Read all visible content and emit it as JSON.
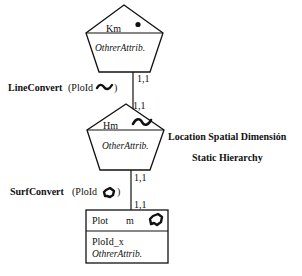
{
  "diagram": {
    "levels": [
      {
        "id": "km",
        "shape": "pentagon",
        "name": "Km",
        "icon": "point-icon",
        "attributes": [
          "OthrerAttrib."
        ]
      },
      {
        "id": "hm",
        "shape": "pentagon",
        "name": "Hm",
        "icon": "line-icon",
        "attributes": [
          "OtherAttrib."
        ]
      },
      {
        "id": "plot",
        "shape": "rectangle",
        "name": "Plot",
        "subname": "m",
        "icon": "surface-icon",
        "attributes": [
          "PloId_x",
          "OthrerAttrib."
        ]
      }
    ],
    "relationships": [
      {
        "label": "LineConvert",
        "param": "(PloId",
        "param_close": ")",
        "icon": "line-icon",
        "card_top": "1,1",
        "card_bottom": "1,1"
      },
      {
        "label": "SurfConvert",
        "param": "(PloId",
        "param_close": ")",
        "icon": "surface-icon",
        "card_top": "1,1",
        "card_bottom": "1,1"
      }
    ],
    "annotation": {
      "line1": "Location Spatial Dimensión",
      "line2": "Static Hierarchy"
    }
  }
}
